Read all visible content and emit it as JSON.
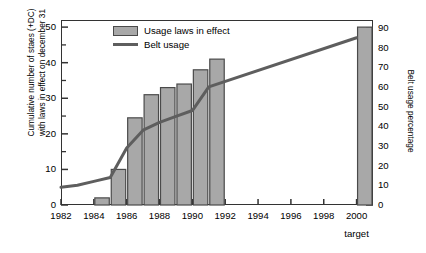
{
  "chart_data": {
    "type": "bar",
    "title": "",
    "xlabel": "",
    "ylabel": "Cumulative number of staes (+DC)\nwith laws in effect on december 31",
    "ylabel_right": "Belt usage percentage",
    "xlim": [
      1982,
      2001
    ],
    "ylim": [
      0,
      52
    ],
    "ylim_right": [
      0,
      94
    ],
    "yticks": [
      0,
      10,
      20,
      30,
      40,
      50
    ],
    "yticks_minor": [
      5,
      15,
      25,
      35,
      45
    ],
    "yticks_right": [
      0,
      10,
      20,
      30,
      40,
      50,
      60,
      70,
      80,
      90
    ],
    "xticks": [
      1982,
      1984,
      1986,
      1988,
      1990,
      1992,
      1994,
      1996,
      1998,
      2000
    ],
    "xtick_sublabels": {
      "2000": "target"
    },
    "grid": false,
    "legend_position": "top-left",
    "legend": [
      {
        "label": "Usage laws in effect",
        "type": "bar",
        "color": "#a8a8a8"
      },
      {
        "label": "Belt usage",
        "type": "line",
        "color": "#5e5e5e"
      }
    ],
    "series": [
      {
        "name": "Usage laws in effect",
        "type": "bar",
        "axis": "left",
        "color": "#a8a8a8",
        "edge_color": "#4a4a4a",
        "categories": [
          1984,
          1985,
          1986,
          1987,
          1988,
          1989,
          1990,
          1991,
          2000
        ],
        "values": [
          2,
          10,
          24.5,
          31,
          33,
          34,
          38,
          41,
          50
        ]
      },
      {
        "name": "Belt usage",
        "type": "line",
        "axis": "right",
        "color": "#5e5e5e",
        "x": [
          1982,
          1983,
          1984,
          1985,
          1986,
          1987,
          1988,
          1989,
          1990,
          1991,
          2000
        ],
        "values": [
          9,
          10,
          12,
          14,
          29,
          38,
          42,
          45,
          48,
          60,
          85
        ]
      }
    ]
  },
  "axes": {
    "y_left_label": "Cumulative number of staes (+DC) with laws in effect on december 31",
    "y_right_label": "Belt usage percentage"
  },
  "legend": {
    "bar_label": "Usage laws in effect",
    "line_label": "Belt usage"
  }
}
